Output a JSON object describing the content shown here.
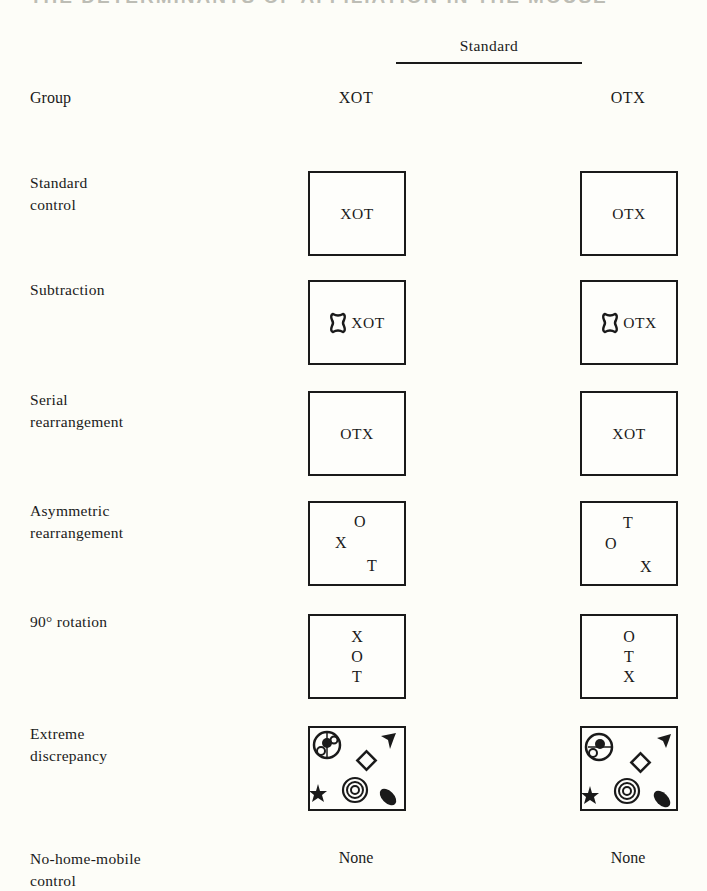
{
  "page": {
    "cropped_heading": "THE DETERMINANTS OF AFFILIATION IN THE MOUSE"
  },
  "table": {
    "column_super_header": "Standard",
    "row_header": "Group",
    "columns": [
      "XOT",
      "OTX"
    ],
    "rows": [
      {
        "label_lines": [
          "Standard",
          "control"
        ],
        "cells": [
          {
            "type": "text",
            "value": "XOT"
          },
          {
            "type": "text",
            "value": "OTX"
          }
        ]
      },
      {
        "label_lines": [
          "Subtraction"
        ],
        "cells": [
          {
            "type": "text-with-icon",
            "icon": "hourglass-blob-icon",
            "value": "XOT"
          },
          {
            "type": "text-with-icon",
            "icon": "hourglass-blob-icon",
            "value": "OTX"
          }
        ]
      },
      {
        "label_lines": [
          "Serial",
          "rearrangement"
        ],
        "cells": [
          {
            "type": "text",
            "value": "OTX"
          },
          {
            "type": "text",
            "value": "XOT"
          }
        ]
      },
      {
        "label_lines": [
          "Asymmetric",
          "rearrangement"
        ],
        "cells": [
          {
            "type": "scatter",
            "letters": [
              "O",
              "X",
              "T"
            ]
          },
          {
            "type": "scatter",
            "letters": [
              "T",
              "O",
              "X"
            ]
          }
        ]
      },
      {
        "label_lines": [
          "90° rotation"
        ],
        "cells": [
          {
            "type": "vertical",
            "letters": [
              "X",
              "O",
              "T"
            ]
          },
          {
            "type": "vertical",
            "letters": [
              "O",
              "T",
              "X"
            ]
          }
        ]
      },
      {
        "label_lines": [
          "Extreme",
          "discrepancy"
        ],
        "cells": [
          {
            "type": "shapes",
            "icons": [
              "spoked-circle-icon",
              "diamond-icon",
              "tri-blade-icon",
              "star-icon",
              "concentric-circles-icon",
              "teardrop-icon"
            ]
          },
          {
            "type": "shapes",
            "icons": [
              "spoked-circle-icon",
              "diamond-icon",
              "tri-blade-icon",
              "star-icon",
              "concentric-circles-icon",
              "teardrop-icon"
            ]
          }
        ]
      },
      {
        "label_lines": [
          "No-home-mobile",
          "control"
        ],
        "cells": [
          {
            "type": "none",
            "value": "None"
          },
          {
            "type": "none",
            "value": "None"
          }
        ]
      }
    ]
  },
  "colors": {
    "ink": "#1a1a1a",
    "paper": "#fdfdf8"
  }
}
